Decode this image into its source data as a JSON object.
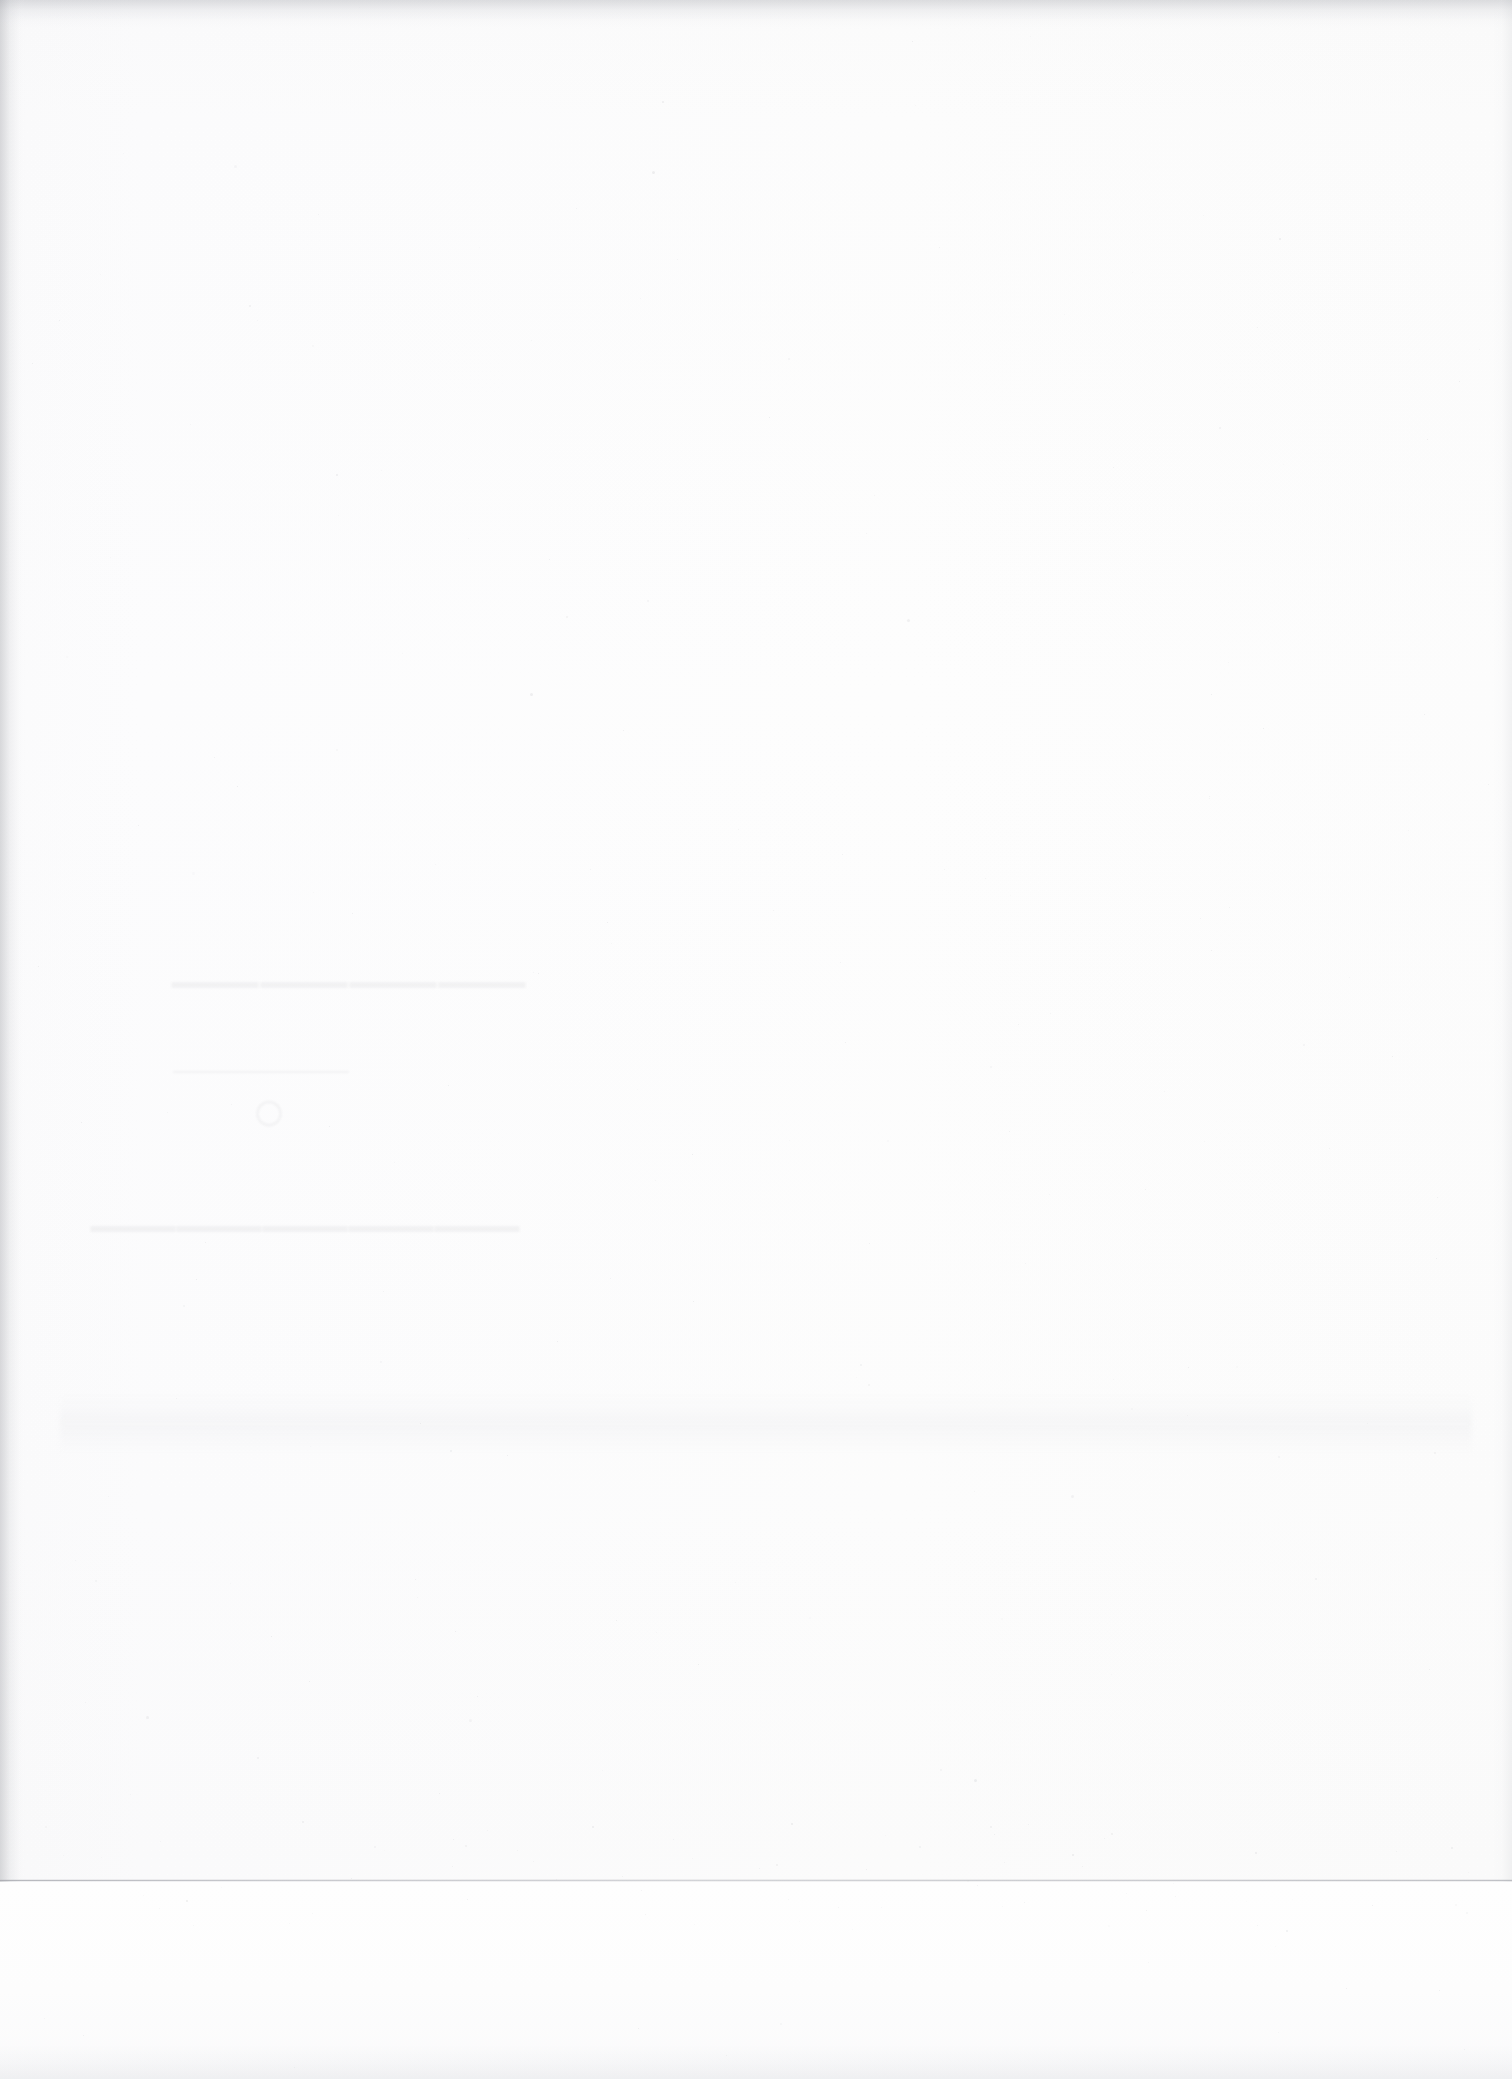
{
  "document": {
    "kind": "scanned-page",
    "description": "Scanned blank verso of a printed leaf",
    "page_content": "",
    "legibility_note": "blank page — no printed content on this side"
  },
  "paper": {
    "base_color": "#fdfdfd",
    "highlight_color": "#fefefe",
    "shadow_color": "#f6f6f7",
    "edge_fringe_color": "#9ea0a6",
    "seam_color": "#b0b2b9"
  },
  "showthrough": {
    "present": true,
    "origin": "ink bleeding through from the printed recto side",
    "orientation": "mirrored",
    "legible": false,
    "ink_color": "#4a4a52",
    "region": {
      "left": 95,
      "top": 928,
      "width": 430,
      "height": 345
    },
    "elements": {
      "line_top": "————",
      "divider_mark": "○",
      "line_bottom": "—————"
    }
  },
  "artifacts": {
    "top_edge_fringe": true,
    "left_edge_fringe": true,
    "right_edge_fringe": true,
    "page_edge_seam_y": 1879,
    "bottom_smudge_band": true,
    "dust_speckles": true
  }
}
